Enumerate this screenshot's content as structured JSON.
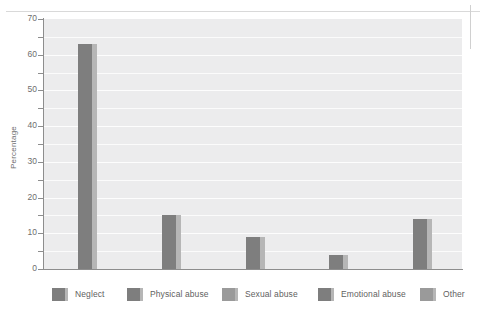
{
  "chart_data": {
    "type": "bar",
    "title": "",
    "xlabel": "",
    "ylabel": "Percentage",
    "ylim": [
      0,
      70
    ],
    "ytick_step": 10,
    "gridline_step": 5,
    "grid": true,
    "legend_position": "bottom",
    "categories": [
      "Neglect",
      "Physical abuse",
      "Sexual abuse",
      "Emotional abuse",
      "Other"
    ],
    "values": [
      63,
      15,
      9,
      4,
      14
    ],
    "ticklabels": [
      "70",
      "60",
      "50",
      "40",
      "30",
      "20",
      "10",
      "0"
    ],
    "tickvalues": [
      70,
      60,
      50,
      40,
      30,
      20,
      10,
      0
    ],
    "series": [
      {
        "name": "Percentage",
        "values": [
          63,
          15,
          9,
          4,
          14
        ]
      }
    ],
    "colors": {
      "bar_face": "#7e7e7e",
      "bar_side": "#b6b6b6",
      "plot_background": "#ececed",
      "gridline": "#fbfbfb",
      "axis": "#8d8d8d",
      "text": "#6e6e6e"
    }
  },
  "legend": {
    "items": [
      {
        "label": "Neglect",
        "color": "#7e7e7e"
      },
      {
        "label": "Physical abuse",
        "color": "#7e7e7e"
      },
      {
        "label": "Sexual abuse",
        "color": "#9a9a9a"
      },
      {
        "label": "Emotional abuse",
        "color": "#7e7e7e"
      },
      {
        "label": "Other",
        "color": "#9a9a9a"
      }
    ]
  }
}
